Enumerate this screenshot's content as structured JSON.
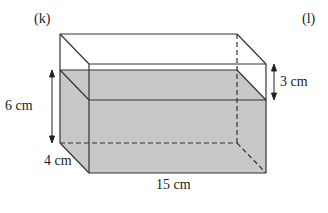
{
  "diagram": {
    "part_label_left": "(k)",
    "part_label_right": "(l)",
    "shape": "rectangular prism (tank) partially filled with water",
    "dimensions": {
      "height_label": "6 cm",
      "width_label": "4 cm",
      "length_label": "15 cm",
      "gap_label": "3 cm"
    },
    "colors": {
      "water_fill": "#c8c8c8",
      "edge": "#333333",
      "background": "#ffffff"
    }
  }
}
